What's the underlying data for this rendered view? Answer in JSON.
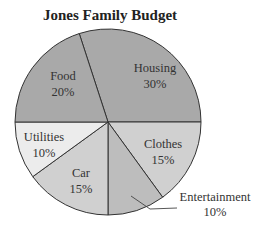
{
  "chart_data": {
    "type": "pie",
    "title": "Jones Family Budget",
    "categories": [
      "Housing",
      "Clothes",
      "Entertainment",
      "Car",
      "Utilities",
      "Food"
    ],
    "values": [
      30,
      15,
      10,
      15,
      10,
      20
    ],
    "labels": [
      "30%",
      "15%",
      "10%",
      "15%",
      "10%",
      "20%"
    ],
    "colors": [
      "#a9a9a9",
      "#d0d0d0",
      "#bdbdbd",
      "#d0d0d0",
      "#ececec",
      "#a9a9a9"
    ],
    "start_angle_deg": -18,
    "direction": "clockwise",
    "legend": "none",
    "annotations": [
      "Entertainment label placed outside slice with leader line"
    ]
  },
  "title": "Jones Family Budget",
  "slices": [
    {
      "name": "Housing",
      "pct": "30%"
    },
    {
      "name": "Clothes",
      "pct": "15%"
    },
    {
      "name": "Entertainment",
      "pct": "10%"
    },
    {
      "name": "Car",
      "pct": "15%"
    },
    {
      "name": "Utilities",
      "pct": "10%"
    },
    {
      "name": "Food",
      "pct": "20%"
    }
  ]
}
